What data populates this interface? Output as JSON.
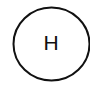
{
  "diagram": {
    "nodes": [
      {
        "label": "H",
        "shape": "circle",
        "stroke_color": "#111111",
        "fill_color": "#ffffff"
      }
    ]
  },
  "colors": {
    "background": "#ffffff",
    "stroke": "#111111",
    "text": "#111111"
  }
}
